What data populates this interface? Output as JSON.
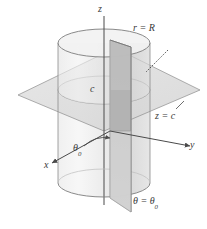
{
  "figure": {
    "background": "#ffffff"
  },
  "labels": {
    "z_axis": "z",
    "y_axis": "y",
    "x_axis": "x",
    "cylinder_surface": "r = R",
    "plane_horizontal": "z = c",
    "height_c": "c",
    "angle_theta0": "θ",
    "angle_theta0_sub": "0",
    "halfplane": "θ = θ",
    "halfplane_sub": "0"
  },
  "geometry": {
    "origin": {
      "x": 110,
      "y": 131
    },
    "cylinder": {
      "radius_r": "R",
      "center_x": 104,
      "top_ellipse_cy": 43,
      "bottom_ellipse_cy": 183,
      "rx": 46,
      "ry": 14
    },
    "horizontal_plane": {
      "label": "z = c",
      "vertices": [
        [
          18,
          95
        ],
        [
          115,
          48
        ],
        [
          200,
          90
        ],
        [
          104,
          131
        ]
      ]
    },
    "vertical_halfplane": {
      "label": "θ = θ0",
      "vertices": [
        [
          110,
          40
        ],
        [
          110,
          198
        ],
        [
          131,
          212
        ],
        [
          131,
          48
        ]
      ]
    },
    "theta0_arc": {
      "start_deg": 210,
      "end_deg": 268,
      "radius": 30
    }
  },
  "colors": {
    "stroke": "#6e6e6e",
    "stroke_dark": "#4a4a4a",
    "axis": "#4a4a4a",
    "text": "#3a3a3a",
    "cylinder_fill": "#e8e8e8",
    "cylinder_top_fill": "#efefef",
    "plane_fill": "#dcdcdc",
    "halfplane_fill": "#c9c9c9",
    "halfplane_fill_dark": "#b5b5b5",
    "shadow": "#d5d5d5"
  }
}
